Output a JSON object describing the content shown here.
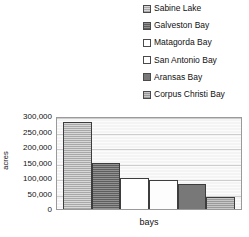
{
  "chart_data": {
    "type": "bar",
    "title": "",
    "xlabel": "bays",
    "ylabel": "acres",
    "categories": [
      "Sabine Lake",
      "Galveston Bay",
      "Matagorda Bay",
      "San Antonio Bay",
      "Aransas Bay",
      "Corpus Christi Bay"
    ],
    "values": [
      280000,
      150000,
      100000,
      92000,
      80000,
      38000
    ],
    "ylim": [
      0,
      300000
    ],
    "ytick_labels": [
      "300,000",
      "250,000",
      "200,000",
      "150,000",
      "100,000",
      "50,000",
      "0"
    ],
    "ytick_values": [
      300000,
      250000,
      200000,
      150000,
      100000,
      50000,
      0
    ],
    "grid": true,
    "legend_position": "top-right",
    "series_colors": [
      "#a8a8a8",
      "#5e5e5e",
      "#ffffff",
      "#fdfdfd",
      "#787878",
      "#9a9a9a"
    ]
  },
  "legend": {
    "items": [
      {
        "label": "Sabine Lake",
        "swatch": "swatch-sabine-lake"
      },
      {
        "label": "Galveston Bay",
        "swatch": "swatch-galveston-bay"
      },
      {
        "label": "Matagorda Bay",
        "swatch": "swatch-matagorda-bay"
      },
      {
        "label": "San Antonio Bay",
        "swatch": "swatch-san-antonio-bay"
      },
      {
        "label": "Aransas Bay",
        "swatch": "swatch-aransas-bay"
      },
      {
        "label": "Corpus Christi Bay",
        "swatch": "swatch-corpus-christi-bay"
      }
    ]
  }
}
